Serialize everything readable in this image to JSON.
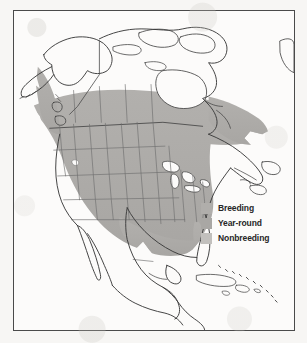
{
  "map": {
    "title": "North American bird range map",
    "region_name": "North America",
    "frame_border_color": "#4a4a4a",
    "page_background": "#f7f6f4",
    "land_fill": "#fcfbfa",
    "coastline_color": "#3a3a3a",
    "state_border_color": "#7a7a7a"
  },
  "legend": {
    "items": [
      {
        "label": "Breeding",
        "color": "#b0aeab",
        "icon": "color-swatch-icon"
      },
      {
        "label": "Year-round",
        "color": "#a9a7a4",
        "icon": "color-swatch-icon"
      },
      {
        "label": "Nonbreeding",
        "color": "#c2c0bd",
        "icon": "color-swatch-icon"
      }
    ]
  },
  "regions": {
    "unshaded": [
      "Alaska",
      "Northern Canada",
      "Mexico",
      "Central America",
      "Caribbean",
      "Greenland edge"
    ],
    "shaded": [
      "Contiguous United States",
      "Southern Canada",
      "Pacific Northwest coast",
      "Florida",
      "Southeastern Quebec",
      "Newfoundland"
    ]
  }
}
